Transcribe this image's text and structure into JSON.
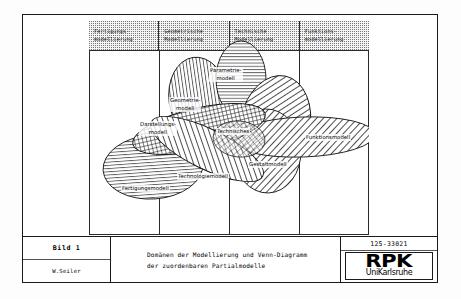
{
  "sheet": {
    "columns": [
      {
        "id": "fertigung",
        "lines": [
          "Fertigungs-",
          "modellierung"
        ]
      },
      {
        "id": "geometrie",
        "lines": [
          "Geometrische",
          "Modellierung"
        ]
      },
      {
        "id": "technik",
        "lines": [
          "Technische",
          "Modellierung"
        ]
      },
      {
        "id": "funktion",
        "lines": [
          "Funktions-",
          "modellierung"
        ]
      }
    ]
  },
  "venn": {
    "ellipses": [
      {
        "id": "parametriemodell",
        "label_lines": [
          "Parametrie-",
          "modell"
        ],
        "hatch": "horizontal"
      },
      {
        "id": "geometriemodell",
        "label_lines": [
          "Geometrie-",
          "modell"
        ],
        "hatch": "vertical"
      },
      {
        "id": "darstellungsmodell",
        "label_lines": [
          "Darstellungs-",
          "modell"
        ],
        "hatch": "cross"
      },
      {
        "id": "technischesmodell",
        "label_lines": [
          "Technisches"
        ],
        "hatch": "diagonal-right"
      },
      {
        "id": "gestaltmodell",
        "label_lines": [
          "Gestaltmodell"
        ],
        "hatch": "diagonal-right"
      },
      {
        "id": "funktionsmodell",
        "label_lines": [
          "Funktionsmodell"
        ],
        "hatch": "diagonal-right"
      },
      {
        "id": "technologiemodell",
        "label_lines": [
          "Technologiemodell"
        ],
        "hatch": "diagonal-left"
      },
      {
        "id": "fertigungsmodell",
        "label_lines": [
          "Fertigungsmodell"
        ],
        "hatch": "horizontal"
      }
    ]
  },
  "title_block": {
    "figure_label": "Bild  1",
    "author": "W.Seiler",
    "caption_line1": "Domänen der Modellierung und Venn-Diagramm",
    "caption_line2": "der zuordenbaren Partialmodelle",
    "doc_number": "125-33021",
    "logo_main": "RPK",
    "logo_sub": "UniKarlsruhe"
  }
}
